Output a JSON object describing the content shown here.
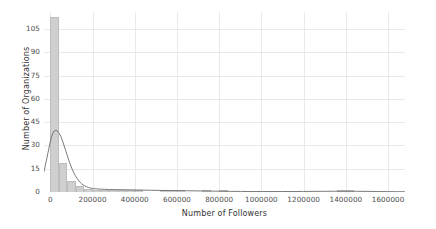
{
  "chart_data": {
    "type": "bar",
    "plot_kind": "histogram-with-kde",
    "title": "",
    "xlabel": "Number of Followers",
    "ylabel": "Number of Organizations",
    "xlim": [
      -30000,
      1680000
    ],
    "ylim": [
      0,
      116
    ],
    "xticks": [
      0,
      200000,
      400000,
      600000,
      800000,
      1000000,
      1200000,
      1400000,
      1600000
    ],
    "xticklabels": [
      "0",
      "200000",
      "400000",
      "600000",
      "800000",
      "1000000",
      "1200000",
      "1400000",
      "1600000"
    ],
    "yticks": [
      0,
      15,
      30,
      45,
      60,
      75,
      90,
      105
    ],
    "yticklabels": [
      "0",
      "15",
      "30",
      "45",
      "60",
      "75",
      "90",
      "105"
    ],
    "grid": true,
    "grid_color": "#e9e9ea",
    "legend": null,
    "bar_color": "#cfcfcf",
    "bar_edge_color": "#bdbdbd",
    "kde_color": "#6b6b6b",
    "bin_width": 40000,
    "bins": [
      {
        "x0": 0,
        "x1": 40000,
        "count": 113
      },
      {
        "x0": 40000,
        "x1": 80000,
        "count": 19
      },
      {
        "x0": 80000,
        "x1": 120000,
        "count": 7
      },
      {
        "x0": 120000,
        "x1": 160000,
        "count": 4
      },
      {
        "x0": 160000,
        "x1": 200000,
        "count": 2
      },
      {
        "x0": 200000,
        "x1": 240000,
        "count": 1
      },
      {
        "x0": 240000,
        "x1": 280000,
        "count": 1
      },
      {
        "x0": 280000,
        "x1": 320000,
        "count": 1
      },
      {
        "x0": 320000,
        "x1": 360000,
        "count": 1
      },
      {
        "x0": 360000,
        "x1": 400000,
        "count": 1
      },
      {
        "x0": 400000,
        "x1": 440000,
        "count": 1
      },
      {
        "x0": 440000,
        "x1": 480000,
        "count": 0
      },
      {
        "x0": 480000,
        "x1": 520000,
        "count": 0
      },
      {
        "x0": 520000,
        "x1": 560000,
        "count": 1
      },
      {
        "x0": 560000,
        "x1": 600000,
        "count": 1
      },
      {
        "x0": 600000,
        "x1": 640000,
        "count": 1
      },
      {
        "x0": 640000,
        "x1": 680000,
        "count": 0
      },
      {
        "x0": 680000,
        "x1": 720000,
        "count": 0
      },
      {
        "x0": 720000,
        "x1": 760000,
        "count": 1
      },
      {
        "x0": 760000,
        "x1": 800000,
        "count": 0
      },
      {
        "x0": 800000,
        "x1": 840000,
        "count": 1
      },
      {
        "x0": 840000,
        "x1": 880000,
        "count": 0
      },
      {
        "x0": 880000,
        "x1": 920000,
        "count": 0
      },
      {
        "x0": 920000,
        "x1": 960000,
        "count": 0
      },
      {
        "x0": 960000,
        "x1": 1000000,
        "count": 0
      },
      {
        "x0": 1000000,
        "x1": 1040000,
        "count": 0
      },
      {
        "x0": 1040000,
        "x1": 1080000,
        "count": 0
      },
      {
        "x0": 1080000,
        "x1": 1120000,
        "count": 0
      },
      {
        "x0": 1120000,
        "x1": 1160000,
        "count": 0
      },
      {
        "x0": 1160000,
        "x1": 1200000,
        "count": 0
      },
      {
        "x0": 1200000,
        "x1": 1240000,
        "count": 0
      },
      {
        "x0": 1240000,
        "x1": 1280000,
        "count": 0
      },
      {
        "x0": 1280000,
        "x1": 1320000,
        "count": 0
      },
      {
        "x0": 1320000,
        "x1": 1360000,
        "count": 0
      },
      {
        "x0": 1360000,
        "x1": 1400000,
        "count": 1
      },
      {
        "x0": 1400000,
        "x1": 1440000,
        "count": 1
      },
      {
        "x0": 1440000,
        "x1": 1480000,
        "count": 0
      },
      {
        "x0": 1480000,
        "x1": 1520000,
        "count": 0
      },
      {
        "x0": 1520000,
        "x1": 1560000,
        "count": 0
      },
      {
        "x0": 1560000,
        "x1": 1600000,
        "count": 0
      }
    ],
    "kde_points": [
      {
        "x": -30000,
        "y": 13.0
      },
      {
        "x": -10000,
        "y": 26.0
      },
      {
        "x": 5000,
        "y": 36.0
      },
      {
        "x": 20000,
        "y": 40.0
      },
      {
        "x": 35000,
        "y": 39.5
      },
      {
        "x": 50000,
        "y": 36.0
      },
      {
        "x": 65000,
        "y": 30.0
      },
      {
        "x": 80000,
        "y": 23.5
      },
      {
        "x": 95000,
        "y": 17.5
      },
      {
        "x": 110000,
        "y": 12.5
      },
      {
        "x": 125000,
        "y": 9.0
      },
      {
        "x": 140000,
        "y": 6.3
      },
      {
        "x": 155000,
        "y": 4.5
      },
      {
        "x": 170000,
        "y": 3.4
      },
      {
        "x": 190000,
        "y": 2.5
      },
      {
        "x": 210000,
        "y": 2.1
      },
      {
        "x": 240000,
        "y": 1.8
      },
      {
        "x": 280000,
        "y": 1.6
      },
      {
        "x": 320000,
        "y": 1.5
      },
      {
        "x": 380000,
        "y": 1.4
      },
      {
        "x": 440000,
        "y": 1.2
      },
      {
        "x": 520000,
        "y": 1.0
      },
      {
        "x": 600000,
        "y": 0.9
      },
      {
        "x": 700000,
        "y": 0.7
      },
      {
        "x": 800000,
        "y": 0.5
      },
      {
        "x": 900000,
        "y": 0.35
      },
      {
        "x": 1000000,
        "y": 0.3
      },
      {
        "x": 1100000,
        "y": 0.3
      },
      {
        "x": 1200000,
        "y": 0.35
      },
      {
        "x": 1300000,
        "y": 0.45
      },
      {
        "x": 1400000,
        "y": 0.5
      },
      {
        "x": 1500000,
        "y": 0.4
      },
      {
        "x": 1600000,
        "y": 0.25
      },
      {
        "x": 1680000,
        "y": 0.15
      }
    ]
  }
}
